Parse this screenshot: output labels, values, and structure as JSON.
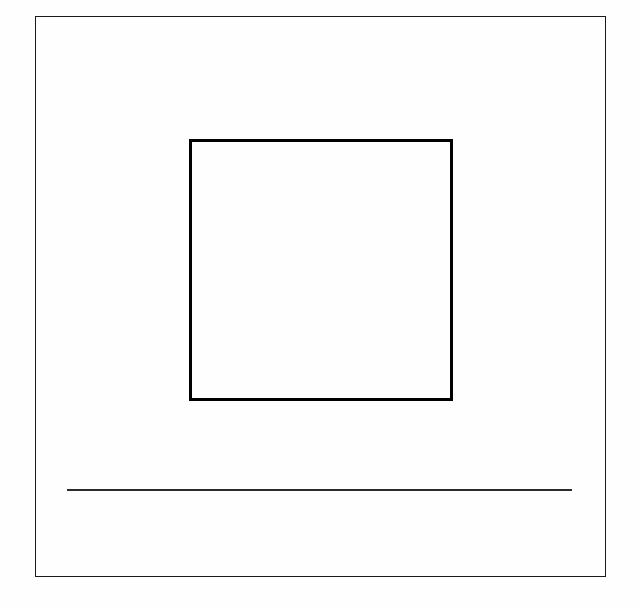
{
  "page": {
    "title": "",
    "width": 640,
    "height": 608,
    "background_color": "#fefefe",
    "text_content": "",
    "caption": ""
  },
  "outer_frame": {
    "label": "",
    "stroke_color": "#1a1a1a",
    "stroke_width_px": 1.5,
    "x": 35,
    "y": 16,
    "width": 571,
    "height": 561
  },
  "inner_square": {
    "label": "",
    "stroke_color": "#000000",
    "stroke_width_px": 3,
    "fill_color": "#ffffff",
    "x": 189,
    "y": 139,
    "width": 264,
    "height": 262,
    "interior_text": ""
  },
  "horizontal_rule": {
    "label": "",
    "stroke_color": "#2a2a2a",
    "stroke_width_px": 1.5,
    "x": 67,
    "y": 489,
    "width": 505
  },
  "regions": {
    "upper_margin_label": "",
    "left_margin_label": "",
    "right_margin_label": "",
    "mid_gap_label": "",
    "lower_margin_label": ""
  }
}
